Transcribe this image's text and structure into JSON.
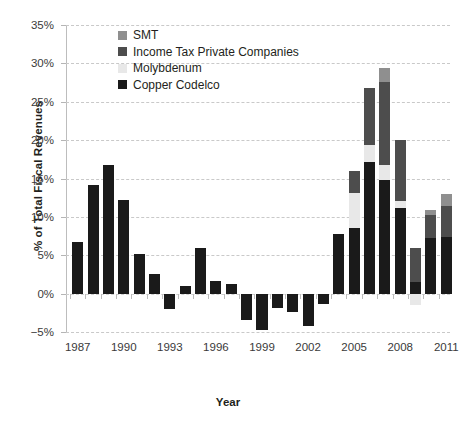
{
  "chart_data": {
    "type": "bar",
    "stacked": true,
    "title": "",
    "xlabel": "Year",
    "ylabel": "% of Total Fiscal Revenues",
    "ylim": [
      -5,
      35
    ],
    "ytick_step": 5,
    "ytick_labels": [
      "35%",
      "30%",
      "25%",
      "20%",
      "15%",
      "10%",
      "5%",
      "0%",
      "−5%"
    ],
    "ytick_values": [
      35,
      30,
      25,
      20,
      15,
      10,
      5,
      0,
      -5
    ],
    "xtick_labels": [
      "1987",
      "1990",
      "1993",
      "1996",
      "1999",
      "2002",
      "2005",
      "2008",
      "2011"
    ],
    "grid": true,
    "legend_position": "upper-left-inside",
    "categories": [
      "1987",
      "1988",
      "1989",
      "1990",
      "1991",
      "1992",
      "1993",
      "1994",
      "1995",
      "1996",
      "1997",
      "1998",
      "1999",
      "2000",
      "2001",
      "2002",
      "2003",
      "2004",
      "2005",
      "2006",
      "2007",
      "2008",
      "2009",
      "2010",
      "2011"
    ],
    "series": [
      {
        "name": "Copper Codelco",
        "color": "#1a1a1a",
        "values": [
          6.7,
          14.2,
          16.8,
          12.2,
          5.2,
          2.5,
          -2.0,
          1.0,
          5.9,
          1.6,
          1.2,
          -3.5,
          -4.7,
          -1.9,
          -2.4,
          -4.2,
          -1.3,
          7.8,
          8.5,
          17.1,
          14.8,
          11.1,
          1.5,
          7.2,
          7.4
        ]
      },
      {
        "name": "Molybdenum",
        "color": "#e8e8e8",
        "values": [
          0,
          0,
          0,
          0,
          0,
          0,
          0,
          0,
          0,
          0,
          0,
          0,
          0,
          0,
          0,
          0,
          0,
          0,
          4.6,
          2.2,
          2.0,
          1.0,
          -1.5,
          0,
          0
        ]
      },
      {
        "name": "Income Tax Private Companies",
        "color": "#4d4d4d",
        "values": [
          0,
          0,
          0,
          0,
          0,
          0,
          0,
          0,
          0,
          0,
          0,
          0,
          0,
          0,
          0,
          0,
          0,
          0,
          2.9,
          7.5,
          10.8,
          7.9,
          4.5,
          3.0,
          4.0
        ]
      },
      {
        "name": "SMT",
        "color": "#8f8f8f",
        "values": [
          0,
          0,
          0,
          0,
          0,
          0,
          0,
          0,
          0,
          0,
          0,
          0,
          0,
          0,
          0,
          0,
          0,
          0,
          0,
          0,
          1.8,
          0,
          0,
          0.7,
          1.6
        ]
      }
    ]
  },
  "legend": {
    "items": [
      {
        "label": "SMT",
        "color": "#8f8f8f"
      },
      {
        "label": "Income Tax Private Companies",
        "color": "#4d4d4d"
      },
      {
        "label": "Molybdenum",
        "color": "#e8e8e8"
      },
      {
        "label": "Copper Codelco",
        "color": "#1a1a1a"
      }
    ]
  },
  "axes": {
    "y_title": "% of Total Fiscal Revenues",
    "x_title": "Year"
  }
}
